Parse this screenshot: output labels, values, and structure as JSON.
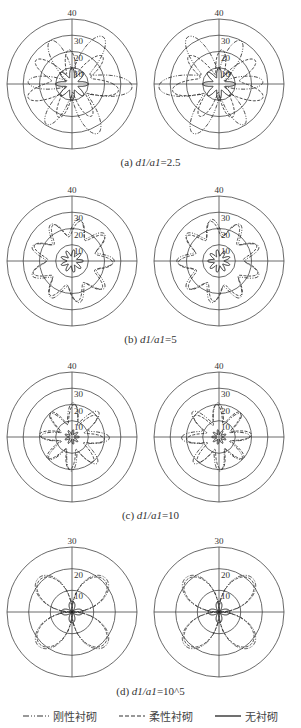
{
  "figure": {
    "panels": [
      {
        "id": "a",
        "caption_prefix": "(a) ",
        "caption_var": "d1/a1",
        "caption_value": "=2.5"
      },
      {
        "id": "b",
        "caption_prefix": "(b) ",
        "caption_var": "d1/a1",
        "caption_value": "=5"
      },
      {
        "id": "c",
        "caption_prefix": "(c) ",
        "caption_var": "d1/a1",
        "caption_value": "=10"
      },
      {
        "id": "d",
        "caption_prefix": "(d) ",
        "caption_var": "d1/a1",
        "caption_value": "=10^5"
      }
    ],
    "legend": [
      {
        "label": "刚性衬砌",
        "style": "dash-dot-dot"
      },
      {
        "label": "柔性衬砌",
        "style": "dashed"
      },
      {
        "label": "无衬砌",
        "style": "solid"
      }
    ]
  },
  "chart_data": [
    {
      "type": "polar",
      "title": "(a) d1/a1=2.5",
      "radial_ticks": [
        10,
        20,
        30,
        40
      ],
      "rlim": [
        0,
        40
      ],
      "subplots": 2,
      "series": [
        {
          "name": "刚性衬砌",
          "description": "6-lobed star, lobes reaching ~30-38"
        },
        {
          "name": "柔性衬砌",
          "description": "lobed curve, ~10-35"
        },
        {
          "name": "无衬砌",
          "description": "small star ~5-12"
        }
      ]
    },
    {
      "type": "polar",
      "title": "(b) d1/a1=5",
      "radial_ticks": [
        10,
        20,
        30,
        40
      ],
      "rlim": [
        0,
        40
      ],
      "subplots": 2,
      "series": [
        {
          "name": "刚性衬砌",
          "description": "~8-lobed curve, r ~15-28"
        },
        {
          "name": "柔性衬砌",
          "description": "~8-lobed curve, r ~15-28"
        },
        {
          "name": "无衬砌",
          "description": "small star r ~3-8"
        }
      ]
    },
    {
      "type": "polar",
      "title": "(c) d1/a1=10",
      "radial_ticks": [
        10,
        20,
        30,
        40
      ],
      "rlim": [
        0,
        40
      ],
      "subplots": 2,
      "series": [
        {
          "name": "刚性衬砌",
          "description": "lobed curve r ~10-22"
        },
        {
          "name": "柔性衬砌",
          "description": "lobed curve r ~10-22"
        },
        {
          "name": "无衬砌",
          "description": "small star r ~2-5"
        }
      ]
    },
    {
      "type": "polar",
      "title": "(d) d1/a1=10^5",
      "radial_ticks": [
        10,
        20,
        30
      ],
      "rlim": [
        0,
        30
      ],
      "subplots": 2,
      "series": [
        {
          "name": "刚性衬砌",
          "description": "4-leaf rose, peak ~22 at 45°"
        },
        {
          "name": "柔性衬砌",
          "description": "4-leaf rose, peak ~22 at 45°"
        },
        {
          "name": "无衬砌",
          "description": "small 4-leaf rose, peak ~5"
        }
      ]
    }
  ]
}
